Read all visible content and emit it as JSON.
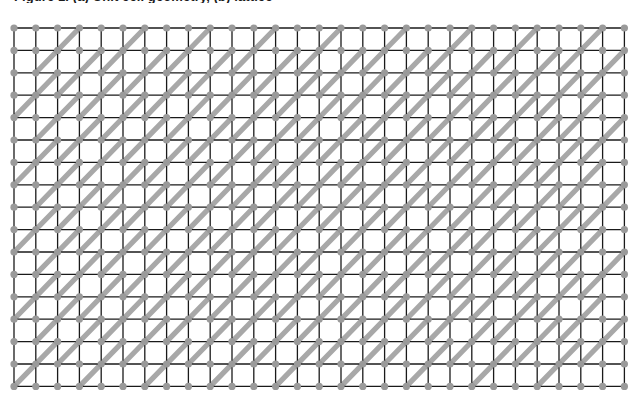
{
  "figure": {
    "title": "Figure 1. (a) Unit cell geometry, (b) lattice",
    "type": "technical-diagram"
  },
  "colors": {
    "background": "#ffffff",
    "grid_line": "#1a1a1a",
    "strut": "#a8a8a8",
    "node": "#9a9a9a",
    "cell_fill": "#ffffff"
  },
  "lattice": {
    "origin_x": 14,
    "origin_y": 28,
    "cell_width": 21.8,
    "cell_height": 22.4,
    "columns": 28,
    "rows": 16,
    "grid_line_width": 1.3,
    "strut_width": 5.2,
    "strut_span_cells": 2,
    "strut_direction": "lower-left-to-upper-right",
    "strut_period_x": 3,
    "strut_period_y": 3,
    "strut_phase_shift_per_row": 1,
    "node_radius": 3.6,
    "node_period_x": 1,
    "node_period_y": 1
  },
  "chart_data": {
    "type": "diagram",
    "title": "Figure 1. (a) Unit cell geometry, (b) lattice",
    "xlabel": "",
    "ylabel": "",
    "grid": true,
    "legend": "none",
    "elements": [
      {
        "name": "cell-outline",
        "count": 448,
        "color": "#1a1a1a",
        "shape": "square"
      },
      {
        "name": "node",
        "count": 493,
        "color": "#9a9a9a",
        "shape": "circle"
      },
      {
        "name": "diagonal-strut",
        "count": 160,
        "color": "#a8a8a8",
        "shape": "thick-line"
      }
    ]
  }
}
